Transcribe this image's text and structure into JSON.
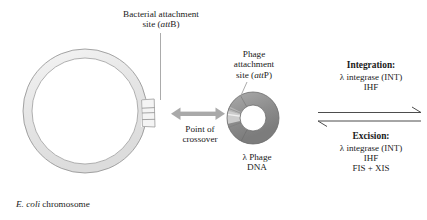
{
  "figure": {
    "background_color": "#ffffff",
    "text_color": "#1a1a1a"
  },
  "labels": {
    "bacterial_attachment": {
      "line1": "Bacterial attachment",
      "line2_prefix": "site (",
      "line2_italic": "att",
      "line2_suffix": "B)"
    },
    "phage_attachment": {
      "line1": "Phage",
      "line2": "attachment",
      "line3_prefix": "site (",
      "line3_italic": "att",
      "line3_suffix": "P)"
    },
    "point_of_crossover": {
      "line1": "Point of",
      "line2": "crossover"
    },
    "phage_dna": {
      "line1": "λ Phage",
      "line2": "DNA"
    },
    "ecoli_chromosome": {
      "italic": "E. coli",
      "rest": " chromosome"
    }
  },
  "reaction_panel": {
    "integration": {
      "heading": "Integration:",
      "factors": [
        "λ integrase (INT)",
        "IHF"
      ]
    },
    "excision": {
      "heading": "Excision:",
      "factors": [
        "λ integrase (INT)",
        "IHF",
        "FIS + XIS"
      ]
    },
    "forward_arrow_direction": "right",
    "reverse_arrow_direction": "left"
  },
  "shapes": {
    "bacterial_chromosome": {
      "kind": "ring",
      "center_x": 85,
      "center_y": 111,
      "outer_radius": 62,
      "inner_radius": 53,
      "fill": "#e9e9e9",
      "stroke": "#8e8e8e"
    },
    "attB_site": {
      "kind": "banded-segment",
      "fill": "#f2f2f2",
      "stroke": "#9a9a9a",
      "band_count": 3
    },
    "phage_dna": {
      "kind": "ring",
      "center_x": 253,
      "center_y": 118,
      "outer_radius": 26,
      "inner_radius": 13,
      "fill": "#8f8f8f",
      "stroke": "#6d6d6d"
    },
    "attP_site": {
      "kind": "segment",
      "fill": "#cfcfcf",
      "stroke": "#8a8a8a"
    },
    "crossover_arrow": {
      "kind": "double-headed-arrow",
      "color": "#a8a8a8",
      "x1": 172,
      "x2": 224,
      "y": 114
    },
    "leader_line_attB": {
      "color": "#9b9b9b",
      "x": 160,
      "y1": 32,
      "y2": 99
    },
    "leader_line_attP": {
      "color": "#9b9b9b",
      "x1": 247,
      "y1": 82,
      "x2": 240,
      "y2": 96
    }
  },
  "colors": {
    "ring_light_fill": "#e9e9e9",
    "ring_light_stroke": "#8e8e8e",
    "ring_dark_fill": "#8f8f8f",
    "ring_dark_stroke": "#6d6d6d",
    "att_band_fill": "#f2f2f2",
    "arrow_gray": "#a8a8a8",
    "reaction_line": "#4a4a4a",
    "text": "#1a1a1a"
  }
}
